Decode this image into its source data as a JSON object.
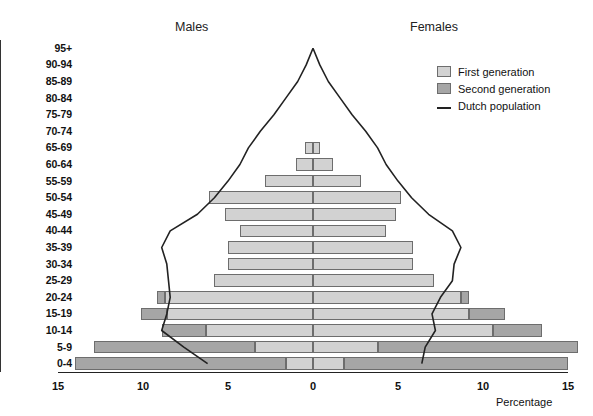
{
  "header": {
    "males_label": "Males",
    "females_label": "Females"
  },
  "legend": {
    "items": [
      {
        "label": "First generation",
        "marker": "swatch",
        "color": "#d2d2d2"
      },
      {
        "label": "Second generation",
        "marker": "swatch",
        "color": "#a6a6a6"
      },
      {
        "label": "Dutch population",
        "marker": "line",
        "color": "#222222"
      }
    ]
  },
  "axis": {
    "x_label": "Percentage",
    "x_ticks": [
      "15",
      "10",
      "5",
      "0",
      "5",
      "10",
      "15"
    ],
    "y_label": ""
  },
  "chart_data": {
    "type": "bar",
    "title": "",
    "subtitle": "",
    "xlabel": "Percentage",
    "ylabel": "",
    "xlim": [
      -15,
      15
    ],
    "grid": false,
    "legend_position": "top-right",
    "orientation": "horizontal-population-pyramid",
    "categories": [
      "95+",
      "90-94",
      "85-89",
      "80-84",
      "75-79",
      "70-74",
      "65-69",
      "60-64",
      "55-59",
      "50-54",
      "45-49",
      "40-44",
      "35-39",
      "30-34",
      "25-29",
      "20-24",
      "15-19",
      "10-14",
      "5-9",
      "0-4"
    ],
    "series": [
      {
        "name": "First generation",
        "side": "males",
        "values": [
          0.0,
          0.0,
          0.0,
          0.0,
          0.0,
          0.0,
          0.5,
          1.0,
          2.8,
          6.1,
          5.2,
          4.3,
          5.0,
          5.0,
          5.8,
          8.7,
          8.6,
          6.3,
          3.4,
          1.6
        ]
      },
      {
        "name": "Second generation",
        "side": "males",
        "values": [
          0.0,
          0.0,
          0.0,
          0.0,
          0.0,
          0.0,
          0.0,
          0.0,
          0.0,
          0.0,
          0.0,
          0.0,
          0.0,
          0.0,
          0.0,
          0.5,
          1.5,
          2.6,
          9.5,
          12.4
        ]
      },
      {
        "name": "First generation",
        "side": "females",
        "values": [
          0.0,
          0.0,
          0.0,
          0.0,
          0.0,
          0.0,
          0.4,
          1.2,
          2.8,
          5.2,
          4.9,
          4.3,
          5.9,
          5.9,
          7.1,
          8.7,
          9.2,
          10.6,
          3.8,
          1.8
        ]
      },
      {
        "name": "Second generation",
        "side": "females",
        "values": [
          0.0,
          0.0,
          0.0,
          0.0,
          0.0,
          0.0,
          0.0,
          0.0,
          0.0,
          0.0,
          0.0,
          0.0,
          0.0,
          0.0,
          0.0,
          0.5,
          2.1,
          2.9,
          11.8,
          13.2
        ]
      },
      {
        "name": "Dutch population",
        "side": "males",
        "type": "line",
        "values": [
          0.0,
          0.4,
          0.9,
          1.6,
          2.3,
          3.1,
          3.8,
          4.3,
          5.0,
          5.8,
          6.8,
          8.4,
          8.9,
          8.6,
          8.5,
          8.4,
          8.6,
          8.9,
          7.6,
          6.2
        ]
      },
      {
        "name": "Dutch population",
        "side": "females",
        "type": "line",
        "values": [
          0.0,
          0.4,
          0.9,
          1.6,
          2.3,
          3.1,
          3.8,
          4.3,
          5.0,
          5.8,
          6.8,
          8.2,
          8.7,
          8.3,
          8.2,
          7.5,
          7.0,
          7.2,
          6.6,
          6.4
        ]
      }
    ]
  }
}
